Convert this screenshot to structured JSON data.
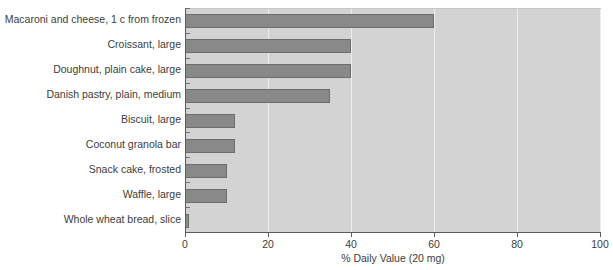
{
  "chart_data": {
    "type": "bar",
    "orientation": "horizontal",
    "title": "",
    "xlabel": "% Daily Value (20 mg)",
    "ylabel": "",
    "xlim": [
      0,
      100
    ],
    "xticks": [
      0,
      20,
      40,
      60,
      80,
      100
    ],
    "grid": true,
    "legend": false,
    "categories": [
      "Macaroni and cheese, 1 c from frozen",
      "Croissant, large",
      "Doughnut, plain cake, large",
      "Danish pastry, plain, medium",
      "Biscuit, large",
      "Coconut granola bar",
      "Snack cake, frosted",
      "Waffle, large",
      "Whole wheat bread, slice"
    ],
    "values": [
      60,
      40,
      40,
      35,
      12,
      12,
      10,
      10,
      1
    ],
    "colors": {
      "bar_fill": "#898989",
      "bar_edge": "#6d6d6d",
      "plot_background": "#d3d3d3",
      "gridline": "#ededed",
      "axis": "#5c5c5c",
      "text": "#3d3d3d",
      "page_background": "#ffffff"
    }
  }
}
